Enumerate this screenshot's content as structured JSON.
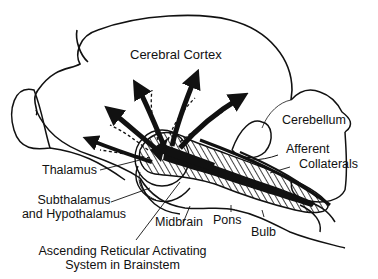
{
  "figure": {
    "title_cut": ""
  },
  "labels": {
    "cortex": "Cerebral Cortex",
    "cerebellum": "Cerebellum",
    "afferent_line1": "Afferent",
    "afferent_line2": "Collaterals",
    "thalamus": "Thalamus",
    "subthalamus_line1": "Subthalamus",
    "subthalamus_line2": "and Hypothalamus",
    "midbrain": "Midbrain",
    "pons": "Pons",
    "bulb": "Bulb",
    "aras_line1": "Ascending Reticular Activating",
    "aras_line2": "System in Brainstem"
  },
  "colors": {
    "ink": "#111111",
    "background": "#ffffff"
  }
}
